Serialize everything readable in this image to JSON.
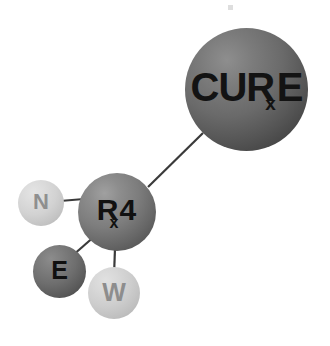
{
  "diagram": {
    "background_color": "#ffffff",
    "nodes": [
      {
        "id": "cure",
        "name": "cure-node",
        "text_main": "CURE",
        "text_lead": "CUR",
        "text_sub": "x",
        "text_trail": "E",
        "size_px": 123,
        "center_x": 246,
        "center_y": 90,
        "fill_color": "#6a6a6a",
        "text_color": "#131313"
      },
      {
        "id": "rx4",
        "name": "rx4-node",
        "text_main": "Rx4",
        "text_lead": "R",
        "text_sub": "x",
        "text_trail": "4",
        "size_px": 78,
        "center_x": 117,
        "center_y": 212,
        "fill_color": "#7d7d7d",
        "text_color": "#111111"
      },
      {
        "id": "n",
        "name": "n-node",
        "text_main": "N",
        "size_px": 46,
        "center_x": 41,
        "center_y": 203,
        "fill_color": "#d2d2d2",
        "text_color": "#8f8f8f"
      },
      {
        "id": "e",
        "name": "e-node",
        "text_main": "E",
        "size_px": 53,
        "center_x": 59,
        "center_y": 271,
        "fill_color": "#6e6e6e",
        "text_color": "#101010"
      },
      {
        "id": "w",
        "name": "w-node",
        "text_main": "W",
        "size_px": 52,
        "center_x": 114,
        "center_y": 293,
        "fill_color": "#cdcdcd",
        "text_color": "#8d8d8d"
      }
    ],
    "bonds": [
      {
        "from": "rx4",
        "to": "cure",
        "color": "#3a3a3a",
        "width": 2
      },
      {
        "from": "n",
        "to": "rx4",
        "color": "#3a3a3a",
        "width": 2
      },
      {
        "from": "e",
        "to": "rx4",
        "color": "#3a3a3a",
        "width": 2
      },
      {
        "from": "rx4",
        "to": "w",
        "color": "#3a3a3a",
        "width": 2
      }
    ]
  }
}
